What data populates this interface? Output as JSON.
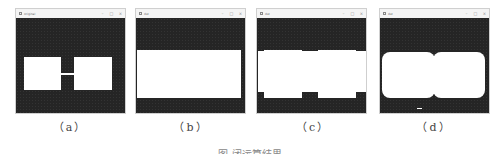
{
  "windows": [
    {
      "id": "a",
      "title": "original",
      "label": "（a）",
      "min": "–",
      "max": "□",
      "close": "×"
    },
    {
      "id": "b",
      "title": "dst",
      "label": "（b）",
      "min": "–",
      "max": "□",
      "close": "×"
    },
    {
      "id": "c",
      "title": "dst",
      "label": "（c）",
      "min": "–",
      "max": "□",
      "close": "×"
    },
    {
      "id": "d",
      "title": "dst",
      "label": "（d）",
      "min": "–",
      "max": "□",
      "close": "×"
    }
  ],
  "colors": {
    "background": "#252525",
    "foreground": "#ffffff",
    "titlebar": "#f4f4f4"
  },
  "caption": "图 闭运算结果"
}
